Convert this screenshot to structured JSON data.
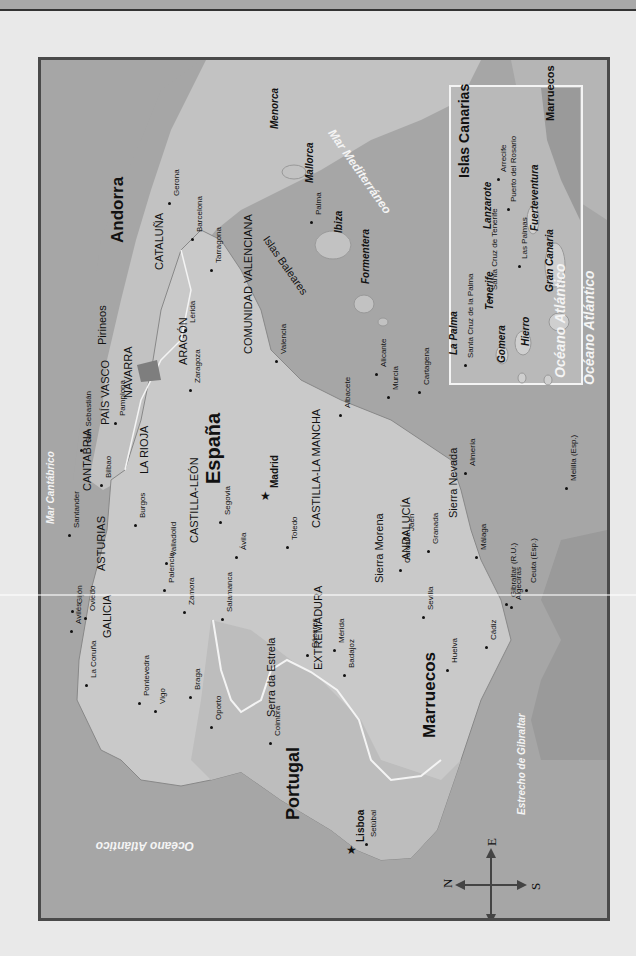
{
  "map": {
    "title": "España y Portugal",
    "colors": {
      "sea": "#a6a6a6",
      "land": "#c9c9c9",
      "border": "#4a4a4a",
      "inset_border": "#ffffff",
      "morocco": "#9a9a9a"
    },
    "countries": [
      {
        "name": "España",
        "x": 203,
        "y": 484,
        "size": 20
      },
      {
        "name": "Portugal",
        "x": 284,
        "y": 820,
        "size": 18
      },
      {
        "name": "Andorra",
        "x": 109,
        "y": 243,
        "size": 17
      },
      {
        "name": "Marruecos",
        "x": 421,
        "y": 738,
        "size": 17
      }
    ],
    "regions": [
      {
        "name": "GALICIA",
        "x": 102,
        "y": 638
      },
      {
        "name": "ASTURIAS",
        "x": 96,
        "y": 571
      },
      {
        "name": "CANTABRIA",
        "x": 82,
        "y": 491
      },
      {
        "name": "PAÍS VASCO",
        "x": 100,
        "y": 425
      },
      {
        "name": "NAVARRA",
        "x": 123,
        "y": 398
      },
      {
        "name": "LA RIOJA",
        "x": 139,
        "y": 474
      },
      {
        "name": "ARAGÓN",
        "x": 178,
        "y": 365
      },
      {
        "name": "CATALUÑA",
        "x": 154,
        "y": 270
      },
      {
        "name": "CASTILLA-LEÓN",
        "x": 189,
        "y": 543
      },
      {
        "name": "CASTILLA-LA MANCHA",
        "x": 311,
        "y": 528
      },
      {
        "name": "COMUNIDAD VALENCIANA",
        "x": 243,
        "y": 354
      },
      {
        "name": "EXTREMADURA",
        "x": 313,
        "y": 670
      },
      {
        "name": "ANDALUCÍA",
        "x": 401,
        "y": 560
      },
      {
        "name": "Sierra Morena",
        "x": 374,
        "y": 583
      },
      {
        "name": "Sierra Nevada",
        "x": 448,
        "y": 518
      },
      {
        "name": "Pirineos",
        "x": 97,
        "y": 345
      },
      {
        "name": "Serra da Estrela",
        "x": 266,
        "y": 717
      }
    ],
    "seas": [
      {
        "name": "Mar Cantábrico",
        "x": 46,
        "y": 524,
        "rot": -90,
        "size": 10
      },
      {
        "name": "Mar Mediterráneo",
        "x": 336,
        "y": 127,
        "rot": 55,
        "size": 12
      },
      {
        "name": "Estrecho de Gibraltar",
        "x": 517,
        "y": 815,
        "rot": -90,
        "size": 10
      },
      {
        "name": "Océano Atlántico",
        "x": 194,
        "y": 852,
        "rot": 180,
        "size": 12
      },
      {
        "name": "Océano Atlántico",
        "x": 553,
        "y": 378,
        "rot": -90,
        "size": 14
      }
    ],
    "islands": [
      {
        "name": "Menorca",
        "x": 270,
        "y": 129
      },
      {
        "name": "Mallorca",
        "x": 305,
        "y": 183
      },
      {
        "name": "Ibiza",
        "x": 334,
        "y": 233
      },
      {
        "name": "Formentera",
        "x": 361,
        "y": 284
      },
      {
        "name": "Islas Baleares",
        "x": 270,
        "y": 234,
        "rot": 55,
        "plain": true
      }
    ],
    "cities": [
      {
        "name": "Madrid",
        "x": 262,
        "y": 488,
        "capital": true,
        "bold": true
      },
      {
        "name": "Lisboa",
        "x": 348,
        "y": 842,
        "capital": true,
        "bold": true
      },
      {
        "name": "Gerona",
        "x": 165,
        "y": 196
      },
      {
        "name": "Barcelona",
        "x": 188,
        "y": 232
      },
      {
        "name": "Tarragona",
        "x": 207,
        "y": 263
      },
      {
        "name": "Lérida",
        "x": 181,
        "y": 323
      },
      {
        "name": "Zaragoza",
        "x": 186,
        "y": 383
      },
      {
        "name": "Valencia",
        "x": 272,
        "y": 354
      },
      {
        "name": "Alicante",
        "x": 372,
        "y": 367
      },
      {
        "name": "Albacete",
        "x": 336,
        "y": 408
      },
      {
        "name": "Murcia",
        "x": 384,
        "y": 390
      },
      {
        "name": "Cartagena",
        "x": 415,
        "y": 385
      },
      {
        "name": "Pamplona",
        "x": 111,
        "y": 416
      },
      {
        "name": "San Sebastián",
        "x": 77,
        "y": 443
      },
      {
        "name": "Bilbao",
        "x": 97,
        "y": 478
      },
      {
        "name": "Santander",
        "x": 65,
        "y": 528
      },
      {
        "name": "Burgos",
        "x": 131,
        "y": 518
      },
      {
        "name": "Segovia",
        "x": 216,
        "y": 515
      },
      {
        "name": "Toledo",
        "x": 283,
        "y": 540
      },
      {
        "name": "Valladolid",
        "x": 162,
        "y": 556
      },
      {
        "name": "Ávila",
        "x": 232,
        "y": 550
      },
      {
        "name": "Palencia",
        "x": 160,
        "y": 583
      },
      {
        "name": "Zamora",
        "x": 180,
        "y": 605
      },
      {
        "name": "Salamanca",
        "x": 218,
        "y": 612
      },
      {
        "name": "Oviedo",
        "x": 81,
        "y": 611
      },
      {
        "name": "Gijón",
        "x": 68,
        "y": 604
      },
      {
        "name": "Avilés",
        "x": 67,
        "y": 624
      },
      {
        "name": "La Coruña",
        "x": 82,
        "y": 678
      },
      {
        "name": "Pontevedra",
        "x": 135,
        "y": 696
      },
      {
        "name": "Vigo",
        "x": 151,
        "y": 704
      },
      {
        "name": "Braga",
        "x": 186,
        "y": 690
      },
      {
        "name": "Oporto",
        "x": 207,
        "y": 720
      },
      {
        "name": "Coimbra",
        "x": 266,
        "y": 736
      },
      {
        "name": "Setúbal",
        "x": 362,
        "y": 837
      },
      {
        "name": "Cáceres",
        "x": 303,
        "y": 648
      },
      {
        "name": "Mérida",
        "x": 330,
        "y": 643
      },
      {
        "name": "Badajoz",
        "x": 340,
        "y": 668
      },
      {
        "name": "Córdoba",
        "x": 396,
        "y": 563
      },
      {
        "name": "Jaén",
        "x": 400,
        "y": 531
      },
      {
        "name": "Granada",
        "x": 424,
        "y": 544
      },
      {
        "name": "Almería",
        "x": 461,
        "y": 466
      },
      {
        "name": "Sevilla",
        "x": 419,
        "y": 610
      },
      {
        "name": "Huelva",
        "x": 443,
        "y": 663
      },
      {
        "name": "Cádiz",
        "x": 482,
        "y": 640
      },
      {
        "name": "Málaga",
        "x": 472,
        "y": 550
      },
      {
        "name": "Algeciras",
        "x": 507,
        "y": 600
      },
      {
        "name": "Gibraltar (R.U.)",
        "x": 502,
        "y": 597
      },
      {
        "name": "Ceuta (Esp.)",
        "x": 522,
        "y": 583
      },
      {
        "name": "Melilla (Esp.)",
        "x": 562,
        "y": 481
      },
      {
        "name": "Palma",
        "x": 307,
        "y": 215
      }
    ],
    "inset": {
      "title": "Islas Canarias",
      "islands": [
        {
          "name": "La Palma",
          "x": 449,
          "y": 355
        },
        {
          "name": "Tenerife",
          "x": 485,
          "y": 310
        },
        {
          "name": "Gomera",
          "x": 497,
          "y": 363
        },
        {
          "name": "Hierro",
          "x": 521,
          "y": 346
        },
        {
          "name": "Gran Canaria",
          "x": 545,
          "y": 292
        },
        {
          "name": "Lanzarote",
          "x": 483,
          "y": 229
        },
        {
          "name": "Fuerteventura",
          "x": 530,
          "y": 231
        }
      ],
      "cities": [
        {
          "name": "Santa Cruz de la Palma",
          "x": 467,
          "y": 358
        },
        {
          "name": "Santa Cruz de Tenerife",
          "x": 491,
          "y": 290
        },
        {
          "name": "Las Palmas",
          "x": 521,
          "y": 259
        },
        {
          "name": "Arrecife",
          "x": 500,
          "y": 172
        },
        {
          "name": "Puerto del Rosario",
          "x": 510,
          "y": 202
        }
      ],
      "marruecos_label": "Marruecos",
      "ocean_label": "Océano Atlántico"
    },
    "compass": {
      "N": "N",
      "S": "S",
      "E": "E",
      "O": "O"
    }
  }
}
